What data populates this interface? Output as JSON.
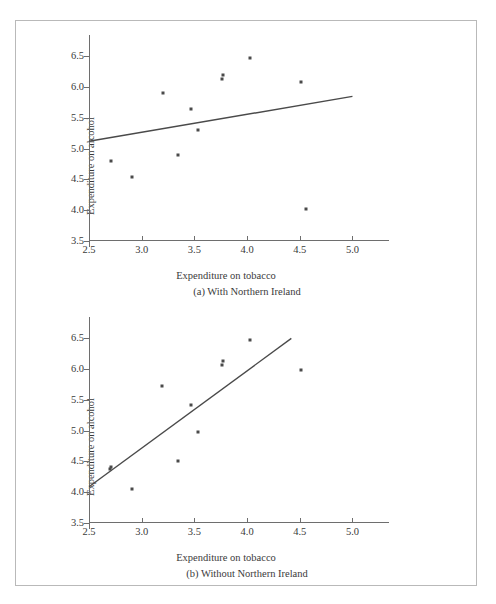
{
  "figure": {
    "background_color": "#ffffff",
    "frame_color": "#b9b9b9",
    "axis_color": "#6e6e6e",
    "marker_color": "#4a4a4a",
    "line_color": "#4a4a4a"
  },
  "chart_data": [
    {
      "type": "scatter",
      "panel_id": "a",
      "title": "(a) With Northern Ireland",
      "xlabel": "Expenditure on tobacco",
      "ylabel": "Expenditure on alcohol",
      "xlim": [
        2.5,
        5.1
      ],
      "ylim": [
        3.5,
        6.75
      ],
      "xticks": [
        2.5,
        3.0,
        3.5,
        4.0,
        4.5,
        5.0
      ],
      "xticklabels": [
        "2.5",
        "3.0",
        "3.5",
        "4.0",
        "4.5",
        "5.0"
      ],
      "yticks": [
        3.5,
        4.0,
        4.5,
        5.0,
        5.5,
        6.0,
        6.5
      ],
      "yticklabels": [
        "3.5",
        "4.0",
        "4.5",
        "5.0",
        "5.5",
        "6.0",
        "6.5"
      ],
      "grid": false,
      "legend": "none",
      "x": [
        2.71,
        2.91,
        3.2,
        3.34,
        3.47,
        3.53,
        3.76,
        3.77,
        4.03,
        4.51,
        4.56
      ],
      "y": [
        4.8,
        4.54,
        5.91,
        4.89,
        5.65,
        5.3,
        6.13,
        6.19,
        6.47,
        6.08,
        4.02
      ],
      "series": [
        {
          "name": "Regions",
          "x": [
            2.71,
            2.91,
            3.2,
            3.34,
            3.47,
            3.53,
            3.76,
            3.77,
            4.03,
            4.51,
            4.56
          ],
          "values": [
            4.8,
            4.54,
            5.91,
            4.89,
            5.65,
            5.3,
            6.13,
            6.19,
            6.47,
            6.08,
            4.02
          ]
        }
      ],
      "fit_line": {
        "label": "least-squares regression line",
        "x_start": 2.5,
        "y_start": 5.12,
        "x_end": 5.0,
        "y_end": 5.85,
        "slope": 0.292,
        "intercept": 4.391
      }
    },
    {
      "type": "scatter",
      "panel_id": "b",
      "title": "(b) Without Northern Ireland",
      "xlabel": "Expenditure on tobacco",
      "ylabel": "Expenditure on alcohol",
      "xlim": [
        2.5,
        5.1
      ],
      "ylim": [
        3.5,
        6.75
      ],
      "xticks": [
        2.5,
        3.0,
        3.5,
        4.0,
        4.5,
        5.0
      ],
      "xticklabels": [
        "2.5",
        "3.0",
        "3.5",
        "4.0",
        "4.5",
        "5.0"
      ],
      "yticks": [
        3.5,
        4.0,
        4.5,
        5.0,
        5.5,
        6.0,
        6.5
      ],
      "yticklabels": [
        "3.5",
        "4.0",
        "4.5",
        "5.0",
        "5.5",
        "6.0",
        "6.5"
      ],
      "grid": false,
      "legend": "none",
      "x": [
        2.7,
        2.71,
        2.91,
        3.19,
        3.34,
        3.47,
        3.53,
        3.76,
        3.77,
        4.03,
        4.51
      ],
      "y": [
        4.38,
        4.41,
        4.05,
        5.73,
        4.51,
        5.42,
        4.98,
        6.07,
        6.14,
        6.47,
        5.99
      ],
      "series": [
        {
          "name": "Regions",
          "x": [
            2.7,
            2.71,
            2.91,
            3.19,
            3.34,
            3.47,
            3.53,
            3.76,
            3.77,
            4.03,
            4.51
          ],
          "values": [
            4.38,
            4.41,
            4.05,
            5.73,
            4.51,
            5.42,
            4.98,
            6.07,
            6.14,
            6.47,
            5.99
          ]
        }
      ],
      "fit_line": {
        "label": "least-squares regression line",
        "x_start": 2.5,
        "y_start": 4.09,
        "x_end": 4.42,
        "y_end": 6.5,
        "slope": 1.256,
        "intercept": 0.951
      }
    }
  ]
}
